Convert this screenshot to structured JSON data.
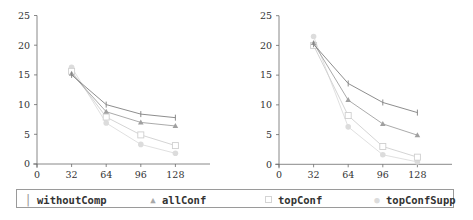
{
  "legend": {
    "items": [
      {
        "label": "withoutComp",
        "marker": "pipe-marker",
        "color": "#808080"
      },
      {
        "label": "allConf",
        "marker": "triangle-marker",
        "color": "#a0a0a0"
      },
      {
        "label": "topConf",
        "marker": "square-marker",
        "color": "#cfcfcf"
      },
      {
        "label": "topConfSupp",
        "marker": "circle-marker",
        "color": "#dcdcdc"
      }
    ]
  },
  "chart_data": [
    {
      "type": "line",
      "title": "",
      "xlabel": "",
      "ylabel": "",
      "x": [
        32,
        64,
        96,
        128
      ],
      "xticks": [
        0,
        32,
        64,
        96,
        128
      ],
      "yticks": [
        0,
        5,
        10,
        15,
        20,
        25
      ],
      "xlim": [
        0,
        160
      ],
      "ylim": [
        0,
        25
      ],
      "grid": false,
      "legend_position": "bottom (shared)",
      "series": [
        {
          "name": "withoutComp",
          "values": [
            15.0,
            10.0,
            8.4,
            7.8
          ],
          "color": "#808080",
          "marker": "pipe"
        },
        {
          "name": "allConf",
          "values": [
            15.2,
            8.8,
            7.0,
            6.4
          ],
          "color": "#a0a0a0",
          "marker": "triangle"
        },
        {
          "name": "topConf",
          "values": [
            15.6,
            7.9,
            4.9,
            3.1
          ],
          "color": "#cfcfcf",
          "marker": "square"
        },
        {
          "name": "topConfSupp",
          "values": [
            16.3,
            6.9,
            3.3,
            1.8
          ],
          "color": "#dcdcdc",
          "marker": "circle"
        }
      ]
    },
    {
      "type": "line",
      "title": "",
      "xlabel": "",
      "ylabel": "",
      "x": [
        32,
        64,
        96,
        128
      ],
      "xticks": [
        0,
        32,
        64,
        96,
        128
      ],
      "yticks": [
        0,
        5,
        10,
        15,
        20,
        25
      ],
      "xlim": [
        0,
        160
      ],
      "ylim": [
        0,
        25
      ],
      "grid": false,
      "legend_position": "bottom (shared)",
      "series": [
        {
          "name": "withoutComp",
          "values": [
            20.2,
            13.6,
            10.4,
            8.7
          ],
          "color": "#808080",
          "marker": "pipe"
        },
        {
          "name": "allConf",
          "values": [
            20.4,
            10.8,
            6.8,
            4.9
          ],
          "color": "#a0a0a0",
          "marker": "triangle"
        },
        {
          "name": "topConf",
          "values": [
            20.0,
            8.2,
            3.0,
            1.2
          ],
          "color": "#cfcfcf",
          "marker": "square"
        },
        {
          "name": "topConfSupp",
          "values": [
            21.5,
            6.3,
            1.6,
            0.4
          ],
          "color": "#dcdcdc",
          "marker": "circle"
        }
      ]
    }
  ]
}
